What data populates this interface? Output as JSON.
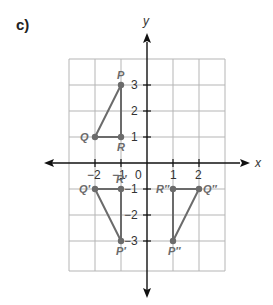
{
  "part_label": "c)",
  "axes": {
    "x_label": "x",
    "y_label": "y",
    "x_ticks": [
      {
        "value": -2,
        "label": "−2"
      },
      {
        "value": -1,
        "label": "−1"
      },
      {
        "value": 0,
        "label": "0"
      },
      {
        "value": 1,
        "label": "1"
      },
      {
        "value": 2,
        "label": "2"
      }
    ],
    "y_ticks": [
      {
        "value": 3,
        "label": "3"
      },
      {
        "value": 2,
        "label": "2"
      },
      {
        "value": 1,
        "label": "1"
      },
      {
        "value": -1,
        "label": "−1"
      },
      {
        "value": -2,
        "label": "−2"
      },
      {
        "value": -3,
        "label": "−3"
      }
    ],
    "grid_x_range": [
      -3,
      3
    ],
    "grid_y_range": [
      -4,
      4
    ]
  },
  "triangles": [
    {
      "name": "PQR",
      "points": [
        {
          "label": "P",
          "x": -1,
          "y": 3
        },
        {
          "label": "Q",
          "x": -2,
          "y": 1
        },
        {
          "label": "R",
          "x": -1,
          "y": 1
        }
      ]
    },
    {
      "name": "P'Q'R'",
      "points": [
        {
          "label": "P′",
          "x": -1,
          "y": -3
        },
        {
          "label": "Q′",
          "x": -2,
          "y": -1
        },
        {
          "label": "R′",
          "x": -1,
          "y": -1
        }
      ]
    },
    {
      "name": "P''Q''R''",
      "points": [
        {
          "label": "P″",
          "x": 1,
          "y": -3
        },
        {
          "label": "Q″",
          "x": 2,
          "y": -1
        },
        {
          "label": "R″",
          "x": 1,
          "y": -1
        }
      ]
    }
  ],
  "colors": {
    "grid": "#b5b5b5",
    "axis": "#111111",
    "shape": "#6b6b6b"
  }
}
